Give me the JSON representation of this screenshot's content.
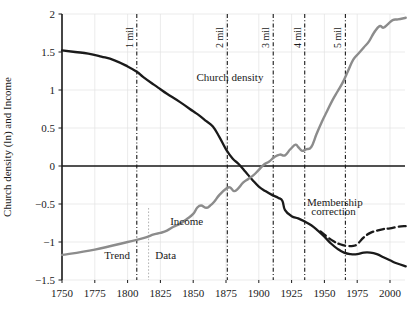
{
  "chart_data": {
    "type": "line",
    "title": "",
    "xlabel": "",
    "ylabel": "Church density (ln) and Income",
    "xlim": [
      1750,
      2012
    ],
    "ylim": [
      -1.5,
      2
    ],
    "grid": true,
    "legend_position": "inline-annotations",
    "xticks": [
      "1750",
      "1775",
      "1800",
      "1825",
      "1850",
      "1875",
      "1900",
      "1925",
      "1950",
      "1975",
      "2000"
    ],
    "xtick_values": [
      1750,
      1775,
      1800,
      1825,
      1850,
      1875,
      1900,
      1925,
      1950,
      1975,
      2000
    ],
    "yticks": [
      "2",
      "1.5",
      "1",
      "0.5",
      "0",
      "-0.5",
      "-1",
      "-1.5"
    ],
    "ytick_values": [
      2,
      1.5,
      1,
      0.5,
      0,
      -0.5,
      -1,
      -1.5
    ],
    "series": [
      {
        "name": "Church density",
        "style": "solid",
        "color": "#1a1a1a",
        "points": [
          [
            1750,
            1.52
          ],
          [
            1760,
            1.5
          ],
          [
            1770,
            1.48
          ],
          [
            1780,
            1.44
          ],
          [
            1790,
            1.39
          ],
          [
            1800,
            1.31
          ],
          [
            1807,
            1.24
          ],
          [
            1812,
            1.17
          ],
          [
            1820,
            1.07
          ],
          [
            1825,
            1.01
          ],
          [
            1830,
            0.95
          ],
          [
            1840,
            0.84
          ],
          [
            1850,
            0.72
          ],
          [
            1855,
            0.66
          ],
          [
            1860,
            0.59
          ],
          [
            1865,
            0.52
          ],
          [
            1870,
            0.38
          ],
          [
            1875,
            0.22
          ],
          [
            1880,
            0.1
          ],
          [
            1885,
            0.02
          ],
          [
            1890,
            -0.08
          ],
          [
            1895,
            -0.18
          ],
          [
            1900,
            -0.27
          ],
          [
            1905,
            -0.33
          ],
          [
            1910,
            -0.38
          ],
          [
            1915,
            -0.42
          ],
          [
            1918,
            -0.46
          ],
          [
            1920,
            -0.58
          ],
          [
            1925,
            -0.66
          ],
          [
            1930,
            -0.69
          ],
          [
            1935,
            -0.73
          ],
          [
            1940,
            -0.78
          ],
          [
            1945,
            -0.85
          ],
          [
            1950,
            -0.93
          ],
          [
            1955,
            -1.02
          ],
          [
            1960,
            -1.09
          ],
          [
            1965,
            -1.14
          ],
          [
            1970,
            -1.16
          ],
          [
            1975,
            -1.16
          ],
          [
            1980,
            -1.14
          ],
          [
            1985,
            -1.14
          ],
          [
            1990,
            -1.16
          ],
          [
            1995,
            -1.2
          ],
          [
            2000,
            -1.24
          ],
          [
            2005,
            -1.28
          ],
          [
            2012,
            -1.32
          ]
        ]
      },
      {
        "name": "Income",
        "style": "solid",
        "color": "#8c8c8c",
        "points": [
          [
            1750,
            -1.17
          ],
          [
            1775,
            -1.1
          ],
          [
            1800,
            -1.0
          ],
          [
            1812,
            -0.95
          ],
          [
            1820,
            -0.9
          ],
          [
            1825,
            -0.88
          ],
          [
            1830,
            -0.85
          ],
          [
            1835,
            -0.8
          ],
          [
            1840,
            -0.76
          ],
          [
            1845,
            -0.7
          ],
          [
            1850,
            -0.63
          ],
          [
            1853,
            -0.55
          ],
          [
            1856,
            -0.52
          ],
          [
            1860,
            -0.55
          ],
          [
            1863,
            -0.52
          ],
          [
            1866,
            -0.47
          ],
          [
            1870,
            -0.38
          ],
          [
            1875,
            -0.3
          ],
          [
            1878,
            -0.28
          ],
          [
            1881,
            -0.33
          ],
          [
            1884,
            -0.3
          ],
          [
            1888,
            -0.22
          ],
          [
            1892,
            -0.17
          ],
          [
            1896,
            -0.12
          ],
          [
            1900,
            -0.05
          ],
          [
            1904,
            0.02
          ],
          [
            1908,
            0.06
          ],
          [
            1912,
            0.12
          ],
          [
            1916,
            0.15
          ],
          [
            1920,
            0.14
          ],
          [
            1924,
            0.22
          ],
          [
            1928,
            0.28
          ],
          [
            1930,
            0.25
          ],
          [
            1933,
            0.2
          ],
          [
            1936,
            0.22
          ],
          [
            1940,
            0.25
          ],
          [
            1944,
            0.42
          ],
          [
            1948,
            0.58
          ],
          [
            1952,
            0.72
          ],
          [
            1956,
            0.86
          ],
          [
            1960,
            0.98
          ],
          [
            1964,
            1.1
          ],
          [
            1968,
            1.25
          ],
          [
            1972,
            1.4
          ],
          [
            1976,
            1.48
          ],
          [
            1980,
            1.56
          ],
          [
            1984,
            1.64
          ],
          [
            1988,
            1.76
          ],
          [
            1992,
            1.84
          ],
          [
            1995,
            1.82
          ],
          [
            1998,
            1.86
          ],
          [
            2002,
            1.92
          ],
          [
            2006,
            1.93
          ],
          [
            2012,
            1.95
          ]
        ]
      },
      {
        "name": "Membership correction",
        "style": "dashed",
        "color": "#1a1a1a",
        "points": [
          [
            1947,
            -0.86
          ],
          [
            1952,
            -0.93
          ],
          [
            1957,
            -0.99
          ],
          [
            1962,
            -1.03
          ],
          [
            1967,
            -1.05
          ],
          [
            1972,
            -1.05
          ],
          [
            1975,
            -1.03
          ],
          [
            1980,
            -0.94
          ],
          [
            1985,
            -0.88
          ],
          [
            1990,
            -0.85
          ],
          [
            1995,
            -0.83
          ],
          [
            2000,
            -0.82
          ],
          [
            2006,
            -0.8
          ],
          [
            2012,
            -0.79
          ]
        ]
      }
    ],
    "vertical_markers": [
      {
        "label": "1 mil",
        "x": 1807
      },
      {
        "label": "2 mil",
        "x": 1876
      },
      {
        "label": "3 mil",
        "x": 1911
      },
      {
        "label": "4 mil",
        "x": 1935
      },
      {
        "label": "5 mil",
        "x": 1966
      }
    ],
    "divider_marker": {
      "label": "",
      "x": 1816
    },
    "annotations": [
      {
        "name": "church-density-label",
        "text": "Church density",
        "x": 1878,
        "y": 1.12
      },
      {
        "name": "income-label",
        "text": "Income",
        "x": 1845,
        "y": -0.78
      },
      {
        "name": "trend-label",
        "text": "Trend",
        "x": 1792,
        "y": -1.22
      },
      {
        "name": "data-label",
        "text": "Data",
        "x": 1829,
        "y": -1.22
      },
      {
        "name": "membership-correction-line1",
        "text": "Membership",
        "x": 1958,
        "y": -0.52
      },
      {
        "name": "membership-correction-line2",
        "text": "correction",
        "x": 1957,
        "y": -0.65
      }
    ],
    "colors": {
      "church_density": "#1a1a1a",
      "income": "#8c8c8c",
      "membership_correction": "#1a1a1a",
      "grid": "#e2e2e2",
      "axis": "#1a1a1a",
      "marker_line": "#1a1a1a"
    }
  }
}
